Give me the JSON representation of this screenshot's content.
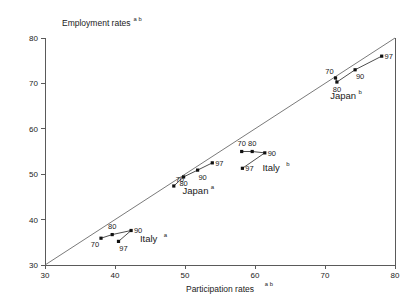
{
  "chart_data": {
    "type": "scatter",
    "title": "",
    "xlabel": "Participation rates",
    "xlabel_sup": "a b",
    "ylabel": "Employment rates",
    "ylabel_sup": "a b",
    "xlim": [
      30,
      80
    ],
    "ylim": [
      30,
      80
    ],
    "xticks": [
      "30",
      "40",
      "50",
      "60",
      "70",
      "80"
    ],
    "yticks": [
      "30",
      "40",
      "50",
      "60",
      "70",
      "80"
    ],
    "xtick_values": [
      30,
      40,
      50,
      60,
      70,
      80
    ],
    "ytick_values": [
      30,
      40,
      50,
      60,
      70,
      80
    ],
    "grid": false,
    "legend": "inline-annotations",
    "reference_line": {
      "name": "45-degree-line",
      "from": [
        30,
        30
      ],
      "to": [
        80,
        80
      ]
    },
    "series": [
      {
        "name": "Italy",
        "sup": "a",
        "label_pos": [
          44.8,
          35.0
        ],
        "points": [
          {
            "year": "70",
            "x": 38.0,
            "y": 35.9,
            "label_pos": "below-left"
          },
          {
            "year": "80",
            "x": 39.6,
            "y": 36.7,
            "label_pos": "above"
          },
          {
            "year": "90",
            "x": 42.3,
            "y": 37.6,
            "label_pos": "right"
          },
          {
            "year": "97",
            "x": 40.5,
            "y": 35.2,
            "label_pos": "below-right"
          }
        ]
      },
      {
        "name": "Japan",
        "sup": "a",
        "label_pos": [
          51.5,
          45.6
        ],
        "points": [
          {
            "year": "70",
            "x": 48.4,
            "y": 47.4,
            "label_pos": "above-right"
          },
          {
            "year": "80",
            "x": 49.8,
            "y": 49.4,
            "label_pos": "below"
          },
          {
            "year": "90",
            "x": 51.8,
            "y": 50.9,
            "label_pos": "below-right"
          },
          {
            "year": "97",
            "x": 53.9,
            "y": 52.5,
            "label_pos": "right"
          }
        ]
      },
      {
        "name": "Italy",
        "sup": "b",
        "label_pos": [
          62.3,
          50.6
        ],
        "points": [
          {
            "year": "70",
            "x": 58.1,
            "y": 55.0,
            "label_pos": "above"
          },
          {
            "year": "80",
            "x": 59.6,
            "y": 55.0,
            "label_pos": "above"
          },
          {
            "year": "90",
            "x": 61.4,
            "y": 54.7,
            "label_pos": "right"
          },
          {
            "year": "97",
            "x": 58.2,
            "y": 51.3,
            "label_pos": "right"
          }
        ]
      },
      {
        "name": "Japan",
        "sup": "b",
        "label_pos": [
          72.6,
          66.5
        ],
        "points": [
          {
            "year": "70",
            "x": 71.5,
            "y": 71.2,
            "label_pos": "above-left"
          },
          {
            "year": "80",
            "x": 71.7,
            "y": 70.3,
            "label_pos": "below"
          },
          {
            "year": "90",
            "x": 74.3,
            "y": 73.0,
            "label_pos": "below-right"
          },
          {
            "year": "97",
            "x": 78.1,
            "y": 76.0,
            "label_pos": "right"
          }
        ]
      }
    ]
  }
}
